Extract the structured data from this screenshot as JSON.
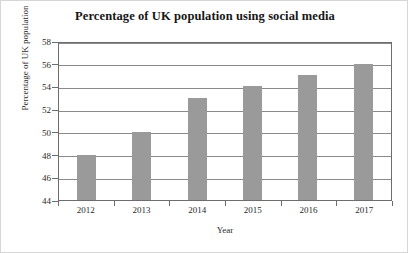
{
  "chart_data": {
    "type": "bar",
    "title": "Percentage of UK population using social media",
    "xlabel": "Year",
    "ylabel": "Percentage of UK population",
    "categories": [
      "2012",
      "2013",
      "2014",
      "2015",
      "2016",
      "2017"
    ],
    "values": [
      48,
      50,
      53,
      54,
      55,
      56
    ],
    "yticks": [
      44,
      46,
      48,
      50,
      52,
      54,
      56,
      58
    ],
    "ylim": [
      44,
      58
    ],
    "grid": true,
    "legend": false,
    "bar_color": "#9a9a9a",
    "frame_color": "#6d6d6d",
    "background": "#ffffff"
  }
}
